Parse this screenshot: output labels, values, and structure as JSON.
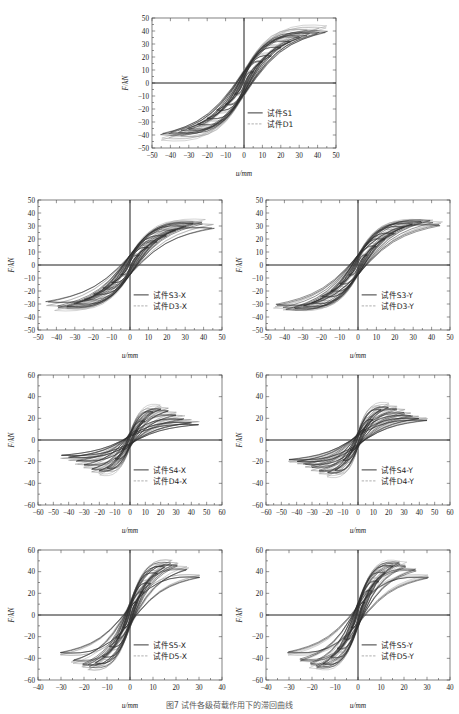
{
  "figure": {
    "caption": "图7  试件各级荷载作用下的滞回曲线",
    "total_panels": 7
  },
  "chart_data": [
    {
      "id": "panel-1",
      "type": "line",
      "title": "",
      "xlabel": "u/mm",
      "ylabel": "F/kN",
      "xlim": [
        -50,
        50
      ],
      "ylim": [
        -50,
        50
      ],
      "xticks": [
        -50,
        -40,
        -30,
        -20,
        -10,
        0,
        10,
        20,
        30,
        40,
        50
      ],
      "yticks": [
        -50,
        -40,
        -30,
        -20,
        -10,
        0,
        10,
        20,
        30,
        40,
        50
      ],
      "grid": false,
      "legend_position": "lower-right",
      "series": [
        {
          "name": "试件S1",
          "style": "solid",
          "color": "#2e2e2e",
          "peaks": [
            {
              "u": 5,
              "F": 9
            },
            {
              "u": 10,
              "F": 17
            },
            {
              "u": 15,
              "F": 22
            },
            {
              "u": 20,
              "F": 28
            },
            {
              "u": 25,
              "F": 33
            },
            {
              "u": 30,
              "F": 37
            },
            {
              "u": 35,
              "F": 39
            },
            {
              "u": 40,
              "F": 41
            },
            {
              "u": 45,
              "F": 41
            }
          ],
          "cycles": 9
        },
        {
          "name": "试件D1",
          "style": "dashed",
          "color": "#9a9a9a",
          "peaks": [
            {
              "u": 5,
              "F": 10
            },
            {
              "u": 10,
              "F": 18
            },
            {
              "u": 15,
              "F": 24
            },
            {
              "u": 20,
              "F": 30
            },
            {
              "u": 25,
              "F": 35
            },
            {
              "u": 30,
              "F": 39
            },
            {
              "u": 35,
              "F": 42
            },
            {
              "u": 40,
              "F": 44
            },
            {
              "u": 45,
              "F": 45
            }
          ],
          "cycles": 9
        }
      ]
    },
    {
      "id": "panel-2",
      "type": "line",
      "title": "",
      "xlabel": "u/mm",
      "ylabel": "F/kN",
      "xlim": [
        -50,
        50
      ],
      "ylim": [
        -50,
        50
      ],
      "xticks": [
        -50,
        -40,
        -30,
        -20,
        -10,
        0,
        10,
        20,
        30,
        40,
        50
      ],
      "yticks": [
        -50,
        -40,
        -30,
        -20,
        -10,
        0,
        10,
        20,
        30,
        40,
        50
      ],
      "grid": false,
      "legend_position": "lower-right",
      "series": [
        {
          "name": "试件S3-X",
          "style": "solid",
          "color": "#2e2e2e",
          "peaks": [
            {
              "u": 5,
              "F": 8
            },
            {
              "u": 10,
              "F": 14
            },
            {
              "u": 15,
              "F": 19
            },
            {
              "u": 20,
              "F": 24
            },
            {
              "u": 25,
              "F": 28
            },
            {
              "u": 30,
              "F": 31
            },
            {
              "u": 35,
              "F": 33
            },
            {
              "u": 40,
              "F": 34
            },
            {
              "u": 45,
              "F": 30
            }
          ],
          "cycles": 9
        },
        {
          "name": "试件D3-X",
          "style": "dashed",
          "color": "#9a9a9a",
          "peaks": [
            {
              "u": 5,
              "F": 9
            },
            {
              "u": 10,
              "F": 16
            },
            {
              "u": 15,
              "F": 21
            },
            {
              "u": 20,
              "F": 26
            },
            {
              "u": 25,
              "F": 30
            },
            {
              "u": 30,
              "F": 33
            },
            {
              "u": 35,
              "F": 35
            },
            {
              "u": 40,
              "F": 36
            },
            {
              "u": 45,
              "F": 33
            }
          ],
          "cycles": 9
        }
      ]
    },
    {
      "id": "panel-3",
      "type": "line",
      "title": "",
      "xlabel": "u/mm",
      "ylabel": "F/kN",
      "xlim": [
        -50,
        50
      ],
      "ylim": [
        -50,
        50
      ],
      "xticks": [
        -50,
        -40,
        -30,
        -20,
        -10,
        0,
        10,
        20,
        30,
        40,
        50
      ],
      "yticks": [
        -50,
        -40,
        -30,
        -20,
        -10,
        0,
        10,
        20,
        30,
        40,
        50
      ],
      "grid": false,
      "legend_position": "lower-right",
      "series": [
        {
          "name": "试件S3-Y",
          "style": "solid",
          "color": "#2e2e2e",
          "peaks": [
            {
              "u": 5,
              "F": 8
            },
            {
              "u": 10,
              "F": 15
            },
            {
              "u": 15,
              "F": 21
            },
            {
              "u": 20,
              "F": 26
            },
            {
              "u": 25,
              "F": 30
            },
            {
              "u": 30,
              "F": 33
            },
            {
              "u": 35,
              "F": 35
            },
            {
              "u": 40,
              "F": 35
            },
            {
              "u": 45,
              "F": 32
            }
          ],
          "cycles": 9
        },
        {
          "name": "试件D3-Y",
          "style": "dashed",
          "color": "#9a9a9a",
          "peaks": [
            {
              "u": 5,
              "F": 9
            },
            {
              "u": 10,
              "F": 17
            },
            {
              "u": 15,
              "F": 23
            },
            {
              "u": 20,
              "F": 28
            },
            {
              "u": 25,
              "F": 32
            },
            {
              "u": 30,
              "F": 35
            },
            {
              "u": 35,
              "F": 37
            },
            {
              "u": 40,
              "F": 37
            },
            {
              "u": 45,
              "F": 34
            }
          ],
          "cycles": 9
        }
      ]
    },
    {
      "id": "panel-4",
      "type": "line",
      "title": "",
      "xlabel": "u/mm",
      "ylabel": "F/kN",
      "xlim": [
        -60,
        60
      ],
      "ylim": [
        -60,
        60
      ],
      "xticks": [
        -60,
        -50,
        -40,
        -30,
        -20,
        -10,
        0,
        10,
        20,
        30,
        40,
        50,
        60
      ],
      "yticks": [
        -60,
        -40,
        -20,
        0,
        20,
        40,
        60
      ],
      "grid": false,
      "legend_position": "lower-right",
      "series": [
        {
          "name": "试件S4-X",
          "style": "solid",
          "color": "#2e2e2e",
          "peaks": [
            {
              "u": 5,
              "F": 9
            },
            {
              "u": 10,
              "F": 18
            },
            {
              "u": 15,
              "F": 27
            },
            {
              "u": 20,
              "F": 30
            },
            {
              "u": 25,
              "F": 28
            },
            {
              "u": 30,
              "F": 24
            },
            {
              "u": 35,
              "F": 20
            },
            {
              "u": 40,
              "F": 17
            },
            {
              "u": 45,
              "F": 15
            }
          ],
          "cycles": 9
        },
        {
          "name": "试件D4-X",
          "style": "dashed",
          "color": "#9a9a9a",
          "peaks": [
            {
              "u": 5,
              "F": 10
            },
            {
              "u": 10,
              "F": 20
            },
            {
              "u": 15,
              "F": 30
            },
            {
              "u": 20,
              "F": 33
            },
            {
              "u": 25,
              "F": 31
            },
            {
              "u": 30,
              "F": 27
            },
            {
              "u": 35,
              "F": 23
            },
            {
              "u": 40,
              "F": 20
            },
            {
              "u": 45,
              "F": 18
            }
          ],
          "cycles": 9
        }
      ]
    },
    {
      "id": "panel-5",
      "type": "line",
      "title": "",
      "xlabel": "u/mm",
      "ylabel": "F/kN",
      "xlim": [
        -60,
        60
      ],
      "ylim": [
        -60,
        60
      ],
      "xticks": [
        -60,
        -50,
        -40,
        -30,
        -20,
        -10,
        0,
        10,
        20,
        30,
        40,
        50,
        60
      ],
      "yticks": [
        -60,
        -40,
        -20,
        0,
        20,
        40,
        60
      ],
      "grid": false,
      "legend_position": "lower-right",
      "series": [
        {
          "name": "试件S4-Y",
          "style": "solid",
          "color": "#2e2e2e",
          "peaks": [
            {
              "u": 5,
              "F": 10
            },
            {
              "u": 10,
              "F": 20
            },
            {
              "u": 15,
              "F": 29
            },
            {
              "u": 20,
              "F": 32
            },
            {
              "u": 25,
              "F": 30
            },
            {
              "u": 30,
              "F": 26
            },
            {
              "u": 35,
              "F": 23
            },
            {
              "u": 40,
              "F": 21
            },
            {
              "u": 45,
              "F": 19
            }
          ],
          "cycles": 9
        },
        {
          "name": "试件D4-Y",
          "style": "dashed",
          "color": "#9a9a9a",
          "peaks": [
            {
              "u": 5,
              "F": 11
            },
            {
              "u": 10,
              "F": 22
            },
            {
              "u": 15,
              "F": 32
            },
            {
              "u": 20,
              "F": 35
            },
            {
              "u": 25,
              "F": 33
            },
            {
              "u": 30,
              "F": 29
            },
            {
              "u": 35,
              "F": 26
            },
            {
              "u": 40,
              "F": 23
            },
            {
              "u": 45,
              "F": 21
            }
          ],
          "cycles": 9
        }
      ]
    },
    {
      "id": "panel-6",
      "type": "line",
      "title": "",
      "xlabel": "u/mm",
      "ylabel": "F/kN",
      "xlim": [
        -40,
        40
      ],
      "ylim": [
        -60,
        60
      ],
      "xticks": [
        -40,
        -30,
        -20,
        -10,
        0,
        10,
        20,
        30,
        40
      ],
      "yticks": [
        -60,
        -40,
        -20,
        0,
        20,
        40,
        60
      ],
      "grid": false,
      "legend_position": "lower-right",
      "series": [
        {
          "name": "试件S5-X",
          "style": "solid",
          "color": "#2e2e2e",
          "peaks": [
            {
              "u": 3,
              "F": 12
            },
            {
              "u": 6,
              "F": 22
            },
            {
              "u": 9,
              "F": 31
            },
            {
              "u": 12,
              "F": 40
            },
            {
              "u": 15,
              "F": 46
            },
            {
              "u": 18,
              "F": 49
            },
            {
              "u": 21,
              "F": 48
            },
            {
              "u": 25,
              "F": 44
            },
            {
              "u": 30,
              "F": 37
            }
          ],
          "cycles": 9
        },
        {
          "name": "试件D5-X",
          "style": "dashed",
          "color": "#9a9a9a",
          "peaks": [
            {
              "u": 3,
              "F": 13
            },
            {
              "u": 6,
              "F": 24
            },
            {
              "u": 9,
              "F": 34
            },
            {
              "u": 12,
              "F": 43
            },
            {
              "u": 15,
              "F": 49
            },
            {
              "u": 18,
              "F": 52
            },
            {
              "u": 21,
              "F": 51
            },
            {
              "u": 25,
              "F": 46
            },
            {
              "u": 30,
              "F": 39
            }
          ],
          "cycles": 9
        }
      ]
    },
    {
      "id": "panel-7",
      "type": "line",
      "title": "",
      "xlabel": "u/mm",
      "ylabel": "F/kN",
      "xlim": [
        -40,
        40
      ],
      "ylim": [
        -60,
        60
      ],
      "xticks": [
        -40,
        -30,
        -20,
        -10,
        0,
        10,
        20,
        30,
        40
      ],
      "yticks": [
        -60,
        -40,
        -20,
        0,
        20,
        40,
        60
      ],
      "grid": false,
      "legend_position": "lower-right",
      "series": [
        {
          "name": "试件S5-Y",
          "style": "solid",
          "color": "#2e2e2e",
          "peaks": [
            {
              "u": 3,
              "F": 12
            },
            {
              "u": 6,
              "F": 23
            },
            {
              "u": 9,
              "F": 33
            },
            {
              "u": 12,
              "F": 41
            },
            {
              "u": 15,
              "F": 47
            },
            {
              "u": 18,
              "F": 50
            },
            {
              "u": 21,
              "F": 48
            },
            {
              "u": 25,
              "F": 43
            },
            {
              "u": 30,
              "F": 36
            }
          ],
          "cycles": 9
        },
        {
          "name": "试件D5-Y",
          "style": "dashed",
          "color": "#9a9a9a",
          "peaks": [
            {
              "u": 3,
              "F": 13
            },
            {
              "u": 6,
              "F": 25
            },
            {
              "u": 9,
              "F": 35
            },
            {
              "u": 12,
              "F": 44
            },
            {
              "u": 15,
              "F": 50
            },
            {
              "u": 18,
              "F": 52
            },
            {
              "u": 21,
              "F": 50
            },
            {
              "u": 25,
              "F": 45
            },
            {
              "u": 30,
              "F": 38
            }
          ],
          "cycles": 9
        }
      ]
    }
  ],
  "colors": {
    "series_s": "#2e2e2e",
    "series_d": "#9a9a9a",
    "frame": "#4a4a4a",
    "zero_axis": "#1c1c1c",
    "background": "#ffffff"
  }
}
